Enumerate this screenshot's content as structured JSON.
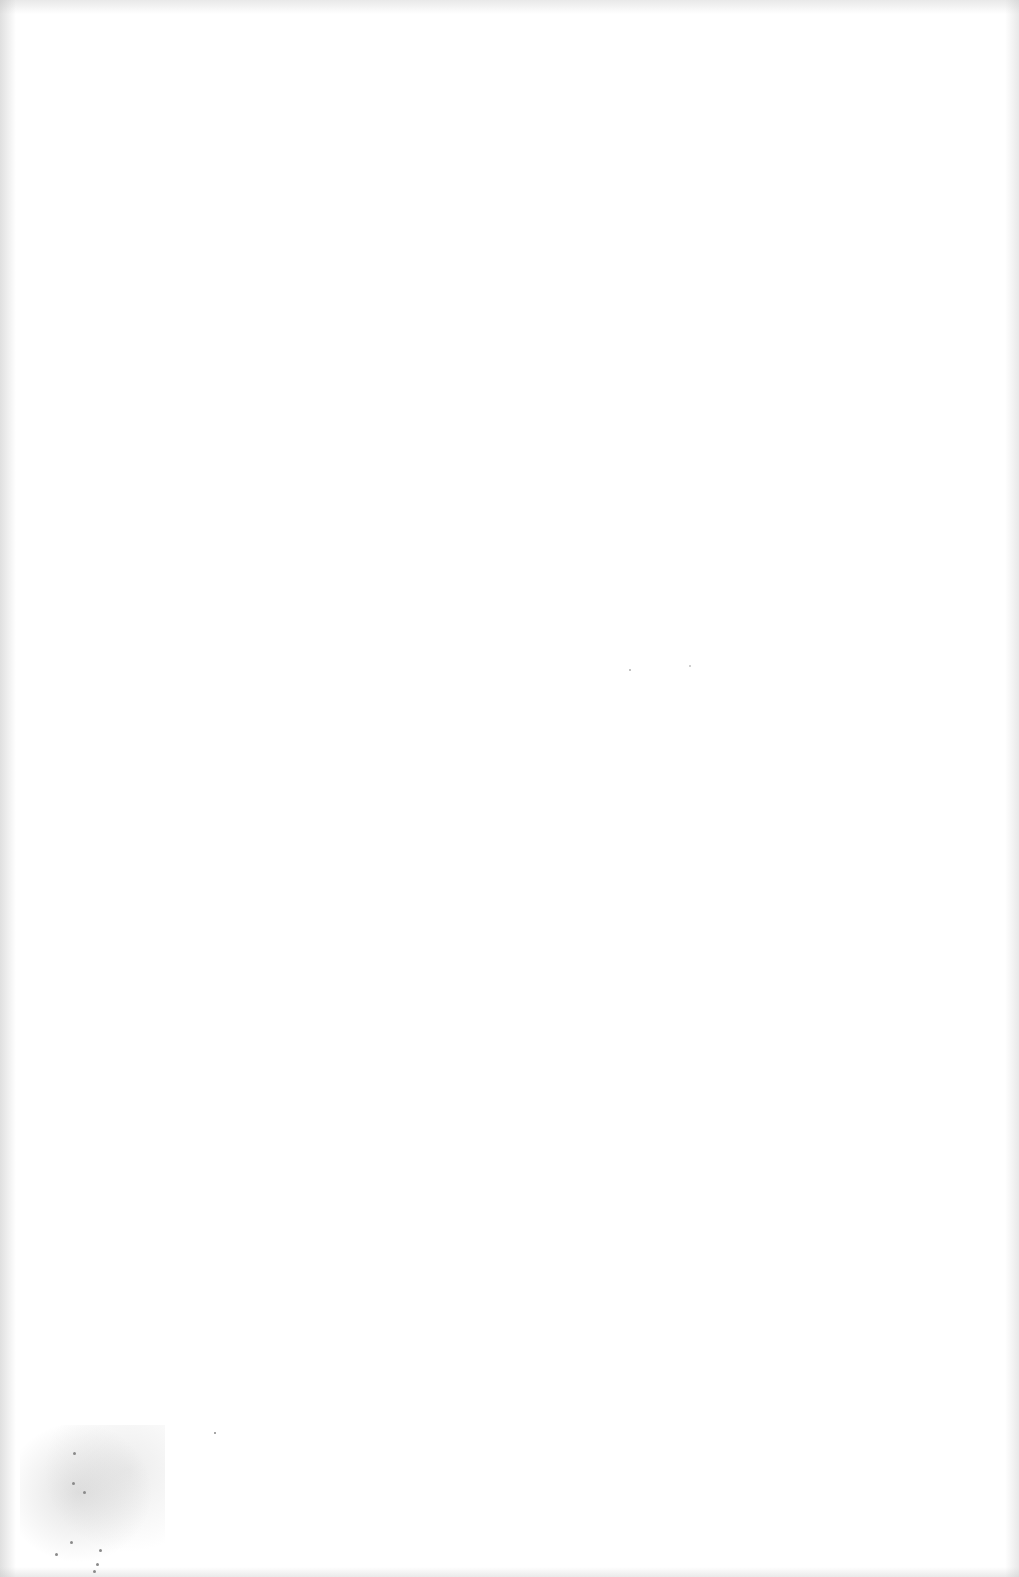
{
  "page": {
    "type": "blank-scanned-page",
    "text_content": ""
  },
  "colors": {
    "paper": "#ffffff",
    "edge_noise": "#bebebe",
    "smudge": "#969696"
  }
}
